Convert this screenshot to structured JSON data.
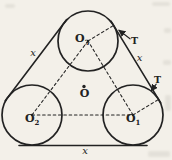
{
  "figure": {
    "labels": {
      "center_point": "O",
      "circle_top": {
        "base": "O",
        "sub": "3"
      },
      "circle_left": {
        "base": "O",
        "sub": "2"
      },
      "circle_right": {
        "base": "O",
        "sub": "1"
      },
      "side_left": "x",
      "side_right": "x",
      "side_bottom": "x",
      "tangent_upper": "T",
      "tangent_lower": "T"
    },
    "colors": {
      "ink": "#222222",
      "paper": "#f3f0e9"
    }
  }
}
